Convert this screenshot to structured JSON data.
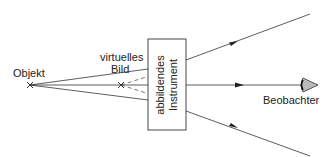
{
  "diagram": {
    "type": "optics-virtual-image",
    "labels": {
      "object": "Objekt",
      "virtual_image_line1": "virtuelles",
      "virtual_image_line2": "Bild",
      "instrument_line1": "abbildendes",
      "instrument_line2": "Instrument",
      "observer": "Beobachter"
    },
    "colors": {
      "line": "#333333",
      "eye_fill": "#bbbbbb",
      "background": "#ffffff"
    }
  }
}
